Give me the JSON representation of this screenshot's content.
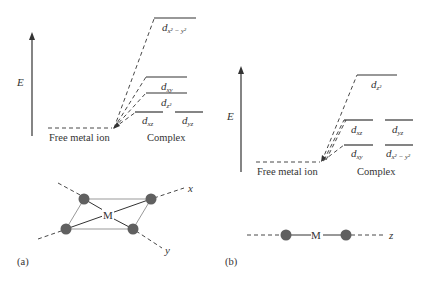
{
  "panel_a": {
    "label": "(a)",
    "energy_axis_label": "E",
    "free_ion_label": "Free metal ion",
    "complex_label": "Complex",
    "levels": [
      {
        "name": "d_x2-y2",
        "base": "d",
        "sub": "x² − y²"
      },
      {
        "name": "d_xy",
        "base": "d",
        "sub": "xy"
      },
      {
        "name": "d_z2",
        "base": "d",
        "sub": "z²"
      },
      {
        "name": "d_xz",
        "base": "d",
        "sub": "xz"
      },
      {
        "name": "d_yz",
        "base": "d",
        "sub": "yz"
      }
    ],
    "geometry": {
      "center_label": "M",
      "axis_x_label": "x",
      "axis_y_label": "y",
      "type": "square planar"
    }
  },
  "panel_b": {
    "label": "(b)",
    "energy_axis_label": "E",
    "free_ion_label": "Free metal ion",
    "complex_label": "Complex",
    "levels": [
      {
        "name": "d_z2",
        "base": "d",
        "sub": "z²"
      },
      {
        "name": "d_xz",
        "base": "d",
        "sub": "xz"
      },
      {
        "name": "d_yz",
        "base": "d",
        "sub": "yz"
      },
      {
        "name": "d_xy",
        "base": "d",
        "sub": "xy"
      },
      {
        "name": "d_x2-y2",
        "base": "d",
        "sub": "x² − y²"
      }
    ],
    "geometry": {
      "center_label": "M",
      "axis_z_label": "z",
      "type": "linear"
    }
  },
  "colors": {
    "line": "#333333",
    "atom": "#606060",
    "frame": "#999999"
  }
}
